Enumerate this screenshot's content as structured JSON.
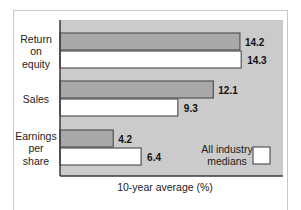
{
  "chart_data": {
    "type": "bar",
    "orientation": "horizontal",
    "title": "",
    "xlabel": "10-year average (%)",
    "ylabel": "",
    "categories": [
      [
        "Return",
        "on",
        "equity"
      ],
      [
        "Sales"
      ],
      [
        "Earnings",
        "per",
        "share"
      ]
    ],
    "series": [
      {
        "name": "Company",
        "values": [
          14.2,
          12.1,
          4.2
        ],
        "color": "#a8a8a8"
      },
      {
        "name": "All industry medians",
        "values": [
          14.3,
          9.3,
          6.4
        ],
        "color": "#ffffff"
      }
    ],
    "value_labels": [
      [
        "14.2",
        "14.3"
      ],
      [
        "12.1",
        "9.3"
      ],
      [
        "4.2",
        "6.4"
      ]
    ],
    "xlim": [
      0,
      17.6
    ],
    "grid": false,
    "legend": {
      "entries": [
        "All industry",
        "medians"
      ],
      "placement": "bottom-right"
    },
    "colors": {
      "plot_background": "#cbcbcb",
      "axis": "#3a3a3a",
      "bar_border": "#555555"
    }
  }
}
